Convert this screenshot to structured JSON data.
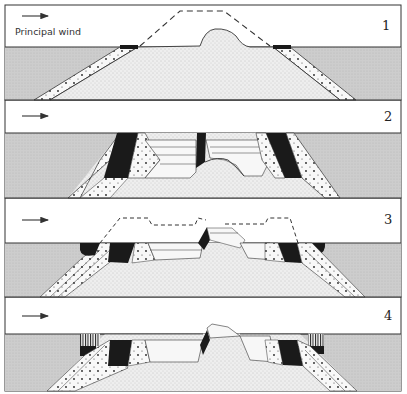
{
  "figure": {
    "wind_label": "Principal wind",
    "wind_direction": "left-to-right",
    "colors": {
      "paper": "#ffffff",
      "water": "#cfcfcf",
      "core": "#ececec",
      "layer": "#f6f6f6",
      "dark": "#1a1a1a",
      "line": "#333333"
    },
    "panels": [
      {
        "id": 1,
        "label": "1",
        "top": 5,
        "bottom": 100,
        "water_y": 47
      },
      {
        "id": 2,
        "label": "2",
        "top": 100,
        "bottom": 198,
        "water_y": 133
      },
      {
        "id": 3,
        "label": "3",
        "top": 198,
        "bottom": 297,
        "water_y": 243
      },
      {
        "id": 4,
        "label": "4",
        "top": 297,
        "bottom": 391,
        "water_y": 334
      }
    ]
  }
}
